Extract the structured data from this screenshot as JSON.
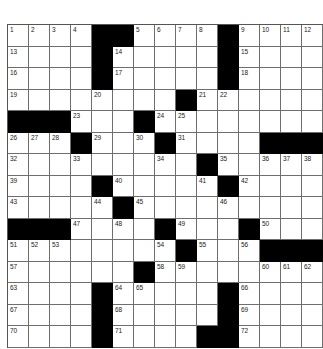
{
  "puzzle": {
    "rows": 15,
    "cols": 15,
    "colors": {
      "black": "#000000",
      "white": "#ffffff",
      "line": "#6e6e6e"
    },
    "grid": [
      [
        "1",
        "2",
        "3",
        "4",
        "#",
        "#",
        "5",
        "6",
        "7",
        "8",
        "#",
        "9",
        "10",
        "11",
        "12"
      ],
      [
        "13",
        ".",
        ".",
        ".",
        "#",
        "14",
        ".",
        ".",
        ".",
        ".",
        "#",
        "15",
        ".",
        ".",
        "."
      ],
      [
        "16",
        ".",
        ".",
        ".",
        "#",
        "17",
        ".",
        ".",
        ".",
        ".",
        "#",
        "18",
        ".",
        ".",
        "."
      ],
      [
        "19",
        ".",
        ".",
        ".",
        "20",
        ".",
        ".",
        ".",
        "#",
        "21",
        "22",
        ".",
        ".",
        ".",
        "."
      ],
      [
        "#",
        "#",
        "#",
        "23",
        ".",
        ".",
        "#",
        "24",
        "25",
        ".",
        ".",
        ".",
        ".",
        ".",
        "."
      ],
      [
        "26",
        "27",
        "28",
        "#",
        "29",
        ".",
        "30",
        "#",
        "31",
        ".",
        ".",
        ".",
        "#",
        "#",
        "#"
      ],
      [
        "32",
        ".",
        ".",
        "33",
        ".",
        ".",
        ".",
        "34",
        ".",
        "#",
        "35",
        ".",
        "36",
        "37",
        "38"
      ],
      [
        "39",
        ".",
        ".",
        ".",
        "#",
        "40",
        ".",
        ".",
        ".",
        "41",
        "#",
        "42",
        ".",
        ".",
        "."
      ],
      [
        "43",
        ".",
        ".",
        ".",
        "44",
        "#",
        "45",
        ".",
        ".",
        ".",
        "46",
        ".",
        ".",
        ".",
        "."
      ],
      [
        "#",
        "#",
        "#",
        "47",
        ".",
        "48",
        ".",
        "#",
        "49",
        ".",
        ".",
        "#",
        "50",
        ".",
        "."
      ],
      [
        "51",
        "52",
        "53",
        ".",
        ".",
        ".",
        ".",
        "54",
        "#",
        "55",
        ".",
        "56",
        "#",
        "#",
        "#"
      ],
      [
        "57",
        ".",
        ".",
        ".",
        ".",
        ".",
        "#",
        "58",
        "59",
        ".",
        ".",
        ".",
        "60",
        "61",
        "62"
      ],
      [
        "63",
        ".",
        ".",
        ".",
        "#",
        "64",
        "65",
        ".",
        ".",
        ".",
        "#",
        "66",
        ".",
        ".",
        "."
      ],
      [
        "67",
        ".",
        ".",
        ".",
        "#",
        "68",
        ".",
        ".",
        ".",
        ".",
        "#",
        "69",
        ".",
        ".",
        "."
      ],
      [
        "70",
        ".",
        ".",
        ".",
        "#",
        "71",
        ".",
        ".",
        ".",
        "#",
        "#",
        "72",
        ".",
        ".",
        "."
      ]
    ]
  }
}
